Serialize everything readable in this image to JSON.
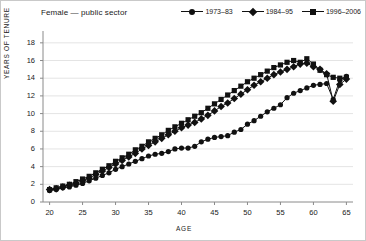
{
  "figure": {
    "title": "Female — public sector",
    "xlabel": "AGE",
    "ylabel": "YEARS OF TENURE"
  },
  "legend": {
    "position": "top-right",
    "items": [
      {
        "label": "1973–83",
        "marker": "circle",
        "color": "#111111"
      },
      {
        "label": "1984–95",
        "marker": "diamond",
        "color": "#111111"
      },
      {
        "label": "1996–2006",
        "marker": "square",
        "color": "#111111"
      }
    ]
  },
  "axes": {
    "x_ticks": [
      20,
      25,
      30,
      35,
      40,
      45,
      50,
      55,
      60,
      65
    ],
    "y_ticks": [
      0,
      2,
      4,
      6,
      8,
      10,
      12,
      14,
      16,
      18
    ],
    "xlim": [
      19,
      66
    ],
    "ylim": [
      0,
      19
    ],
    "grid": "horizontal"
  },
  "chart_data": {
    "type": "line",
    "title": "Female — public sector",
    "xlabel": "AGE",
    "ylabel": "YEARS OF TENURE",
    "xlim": [
      19,
      66
    ],
    "ylim": [
      0,
      19
    ],
    "grid": true,
    "legend_position": "top-right",
    "x": [
      20,
      21,
      22,
      23,
      24,
      25,
      26,
      27,
      28,
      29,
      30,
      31,
      32,
      33,
      34,
      35,
      36,
      37,
      38,
      39,
      40,
      41,
      42,
      43,
      44,
      45,
      46,
      47,
      48,
      49,
      50,
      51,
      52,
      53,
      54,
      55,
      56,
      57,
      58,
      59,
      60,
      61,
      62,
      63,
      64,
      65
    ],
    "series": [
      {
        "name": "1973–83",
        "marker": "circle",
        "color": "#111111",
        "values": [
          1.3,
          1.4,
          1.6,
          1.7,
          1.9,
          2.1,
          2.4,
          2.7,
          3.0,
          3.3,
          3.7,
          4.0,
          4.3,
          4.6,
          4.9,
          5.2,
          5.4,
          5.5,
          5.7,
          6.0,
          6.1,
          6.1,
          6.3,
          6.8,
          7.1,
          7.3,
          7.4,
          7.5,
          7.9,
          8.2,
          8.8,
          9.2,
          9.7,
          10.2,
          10.6,
          11.0,
          11.8,
          12.3,
          12.6,
          12.9,
          13.2,
          13.3,
          13.4,
          11.6,
          13.8,
          14.2
        ]
      },
      {
        "name": "1984–95",
        "marker": "diamond",
        "color": "#111111",
        "values": [
          1.4,
          1.5,
          1.7,
          1.9,
          2.1,
          2.4,
          2.7,
          3.1,
          3.5,
          3.9,
          4.3,
          4.7,
          5.1,
          5.5,
          6.0,
          6.4,
          6.8,
          7.2,
          7.6,
          8.0,
          8.4,
          8.7,
          9.0,
          9.4,
          9.8,
          10.3,
          10.8,
          11.2,
          11.7,
          12.2,
          12.7,
          13.2,
          13.6,
          14.0,
          14.4,
          14.7,
          15.0,
          15.3,
          15.6,
          15.7,
          15.3,
          15.0,
          14.5,
          11.4,
          13.3,
          13.9
        ]
      },
      {
        "name": "1996–2006",
        "marker": "square",
        "color": "#111111",
        "values": [
          1.4,
          1.6,
          1.8,
          2.0,
          2.3,
          2.6,
          2.9,
          3.3,
          3.7,
          4.1,
          4.6,
          5.0,
          5.4,
          5.9,
          6.3,
          6.8,
          7.2,
          7.6,
          8.1,
          8.5,
          8.9,
          9.3,
          9.7,
          10.1,
          10.6,
          11.1,
          11.6,
          12.1,
          12.6,
          13.1,
          13.6,
          14.0,
          14.4,
          14.8,
          15.2,
          15.5,
          15.8,
          16.0,
          15.8,
          16.2,
          15.6,
          14.9,
          14.4,
          14.1,
          14.0,
          14.1
        ]
      }
    ]
  }
}
